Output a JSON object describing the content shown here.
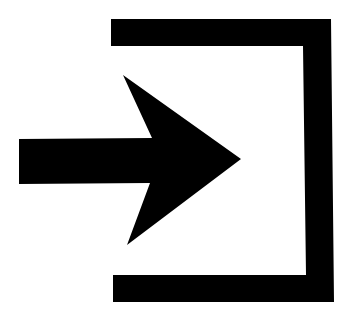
{
  "icon": {
    "name": "login-icon",
    "description": "Arrow pointing right into a bracket (sign in / enter)",
    "color": "#000000",
    "background": "#ffffff"
  }
}
